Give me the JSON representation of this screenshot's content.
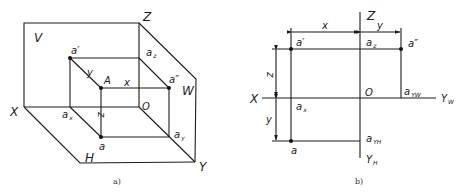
{
  "figure_a": {
    "caption": "a)",
    "planes": {
      "V": "V",
      "H": "H",
      "W": "W"
    },
    "axes": {
      "X": "X",
      "Y": "Y",
      "Z": "Z",
      "O": "O"
    },
    "points": {
      "A": "A",
      "a": "a",
      "a_prime": "a′",
      "a_double_prime": "a″",
      "a_x": "a",
      "a_x_sub": "x",
      "a_y": "a",
      "a_y_sub": "y",
      "a_z": "a",
      "a_z_sub": "z"
    },
    "dimensions": {
      "x": "x",
      "y": "y",
      "z": "z"
    }
  },
  "figure_b": {
    "caption": "b)",
    "axes": {
      "X": "X",
      "Z": "Z",
      "O": "O",
      "Y_W": "Y",
      "Y_W_sub": "W",
      "Y_H": "Y",
      "Y_H_sub": "H"
    },
    "points": {
      "a_prime": "a′",
      "a_double_prime": "a″",
      "a": "a",
      "a_x": "a",
      "a_x_sub": "x",
      "a_z": "a",
      "a_z_sub": "z",
      "a_yw": "a",
      "a_yw_sub": "YW",
      "a_yh": "a",
      "a_yh_sub": "YH"
    },
    "dimensions": {
      "x": "x",
      "y_top": "y",
      "z": "z",
      "y_left": "y"
    }
  }
}
